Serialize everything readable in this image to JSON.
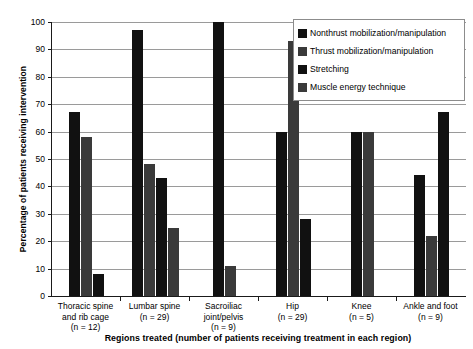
{
  "chart_data": {
    "type": "bar",
    "title": "",
    "subtitle": "",
    "xlabel": "Regions treated (number of patients receiving treatment in each region)",
    "ylabel": "Percentage of patients receiving intervention",
    "ylim": [
      0,
      100
    ],
    "ytick_step": 10,
    "ytick_labels": [
      "0",
      "10",
      "20",
      "30",
      "40",
      "50",
      "60",
      "70",
      "80",
      "90",
      "100"
    ],
    "grid": "horizontal",
    "legend_position": "top-right",
    "categories": [
      "Thoracic spine\nand rib cage\n(n = 12)",
      "Lumbar spine\n(n = 29)",
      "Sacroiliac\njoint/pelvis\n(n = 9)",
      "Hip\n(n = 29)",
      "Knee\n(n = 5)",
      "Ankle and foot\n(n = 9)"
    ],
    "category_names": [
      "Thoracic spine and rib cage",
      "Lumbar spine",
      "Sacroiliac joint/pelvis",
      "Hip",
      "Knee",
      "Ankle and foot"
    ],
    "category_counts": [
      "n = 12",
      "n = 29",
      "n = 9",
      "n = 29",
      "n = 5",
      "n = 9"
    ],
    "series": [
      {
        "name": "Nonthrust mobilization/manipulation",
        "color": "#111111",
        "values": [
          67,
          97,
          100,
          60,
          60,
          44
        ]
      },
      {
        "name": "Thrust mobilization/manipulation",
        "color": "#3a3a3a",
        "values": [
          58,
          48,
          11,
          93,
          60,
          22
        ]
      },
      {
        "name": "Stretching",
        "color": "#111111",
        "values": [
          8,
          43,
          null,
          28,
          null,
          67
        ]
      },
      {
        "name": "Muscle energy technique",
        "color": "#3a3a3a",
        "values": [
          null,
          25,
          null,
          null,
          null,
          null
        ]
      }
    ]
  },
  "legend": {
    "items": [
      {
        "label": "Nonthrust mobilization/manipulation",
        "color": "#111111"
      },
      {
        "label": "Thrust mobilization/manipulation",
        "color": "#3a3a3a"
      },
      {
        "label": "Stretching",
        "color": "#111111"
      },
      {
        "label": "Muscle energy technique",
        "color": "#3a3a3a"
      }
    ]
  },
  "axes": {
    "y_title": "Percentage of patients receiving intervention",
    "x_title": "Regions treated (number of patients receiving treatment in each region)"
  },
  "colors": {
    "axis": "#1a1a1a",
    "grid": "#9a9a9a",
    "legend_border": "#8c8c8c",
    "background": "#ffffff"
  }
}
